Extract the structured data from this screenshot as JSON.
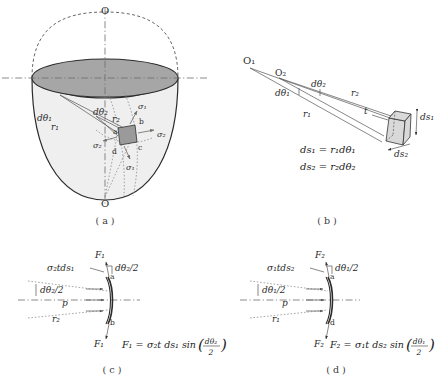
{
  "figure": {
    "colors": {
      "line": "#2b2b2b",
      "shade_dark": "#a6a6a6",
      "shade_body": "#efefef",
      "shade_element": "#9a9a9a",
      "shade_block": "#d9d9d9",
      "dash": "#4a4a4a",
      "dot": "#8a8a8a"
    }
  },
  "panels": {
    "a": {
      "label": "( a )",
      "axis_top_label": "O",
      "axis_bottom_label": "O",
      "labels": {
        "dtheta1": "dθ₁",
        "dtheta2": "dθ₂",
        "r1": "r₁",
        "r2": "r₂",
        "sigma1_upper": "σ₁",
        "sigma1_lower": "σ₁",
        "sigma2_right": "σ₂",
        "sigma2_left": "σ₂",
        "corner_a": "a",
        "corner_b": "b",
        "corner_c": "c",
        "corner_d": "d"
      }
    },
    "b": {
      "label": "( b )",
      "labels": {
        "O1": "O₁",
        "O2": "O₂",
        "dtheta1": "dθ₁",
        "dtheta2": "dθ₂",
        "r1": "r₁",
        "r2": "r₂",
        "t": "t",
        "ds1": "ds₁",
        "ds2": "ds₂"
      },
      "equations": [
        "ds₁ = r₁dθ₁",
        "ds₂ = r₂dθ₂"
      ]
    },
    "c": {
      "label": "( c )",
      "labels": {
        "F_top": "F₁",
        "F_bottom": "F₁",
        "stress_force": "σ₂tds₁",
        "half_angle_top": "dθ₂/2",
        "half_angle_left": "dθ₂/2",
        "pressure": "p",
        "radius": "r₂",
        "corner_a": "a",
        "corner_b": "b"
      },
      "equation": "F₁ = σ₂t ds₁ sin(dθ₂/2)",
      "equation_parts": {
        "lhs": "F₁ =",
        "rhs_prefix": "σ₂t ds₁ sin",
        "frac_num": "dθ₂",
        "frac_den": "2"
      }
    },
    "d": {
      "label": "( d )",
      "labels": {
        "F_top": "F₂",
        "F_bottom": "F₂",
        "stress_force": "σ₁tds₂",
        "half_angle_top": "dθ₁/2",
        "half_angle_left": "dθ₁/2",
        "pressure": "p",
        "radius": "r₁",
        "corner_a": "a",
        "corner_d": "d"
      },
      "equation": "F₂ = σ₁t ds₂ sin(dθ₁/2)",
      "equation_parts": {
        "lhs": "F₂ =",
        "rhs_prefix": "σ₁t ds₂ sin",
        "frac_num": "dθ₁",
        "frac_den": "2"
      }
    }
  }
}
